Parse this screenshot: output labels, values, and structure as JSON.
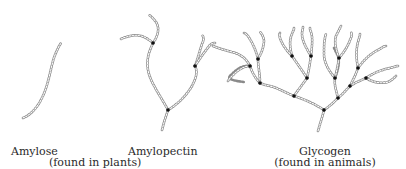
{
  "diagram": {
    "structures": [
      {
        "id": "amylose",
        "name": "Amylose",
        "branching": "unbranched"
      },
      {
        "id": "amylopectin",
        "name": "Amylopectin",
        "branching": "moderately branched"
      },
      {
        "id": "glycogen",
        "name": "Glycogen",
        "branching": "highly branched"
      }
    ],
    "labels": {
      "amylose": "Amylose",
      "amylopectin": "Amylopectin",
      "plants_note": "(found in plants)",
      "glycogen": "Glycogen",
      "animals_note": "(found in animals)"
    },
    "colors": {
      "chain": "#8a8a8a",
      "branch_point": "#111111",
      "text": "#2a2a2a",
      "background": "#ffffff"
    }
  }
}
